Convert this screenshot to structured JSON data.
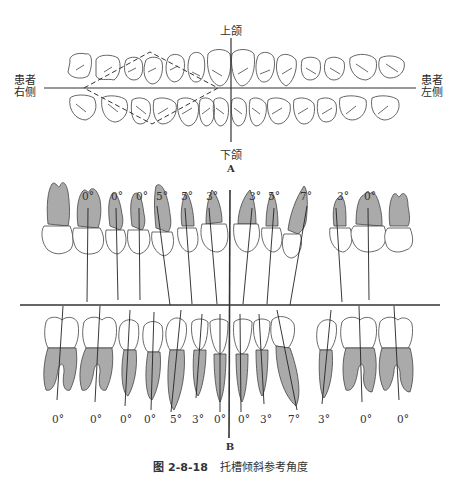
{
  "figure": {
    "number": "图 2-8-18",
    "title": "托槽倾斜参考角度"
  },
  "panel_a": {
    "label": "A",
    "top_label": "上颌",
    "bottom_label": "下颌",
    "left_label_line1": "患者",
    "left_label_line2": "右侧",
    "right_label_line1": "患者",
    "right_label_line2": "左侧",
    "upper_teeth_count": 14,
    "lower_teeth_count": 14
  },
  "panel_b": {
    "label": "B",
    "upper_angles": [
      {
        "x": 88,
        "label": "0°"
      },
      {
        "x": 117,
        "label": "0°"
      },
      {
        "x": 142,
        "label": "0°"
      },
      {
        "x": 162,
        "label": "5°"
      },
      {
        "x": 187,
        "label": "5°"
      },
      {
        "x": 212,
        "label": "3°"
      },
      {
        "x": 255,
        "label": "3°"
      },
      {
        "x": 274,
        "label": "5°"
      },
      {
        "x": 306,
        "label": "7°"
      },
      {
        "x": 343,
        "label": "3°"
      },
      {
        "x": 370,
        "label": "0°"
      }
    ],
    "lower_angles": [
      {
        "x": 58,
        "label": "0°"
      },
      {
        "x": 96,
        "label": "0°"
      },
      {
        "x": 126,
        "label": "0°"
      },
      {
        "x": 150,
        "label": "0°"
      },
      {
        "x": 176,
        "label": "5°"
      },
      {
        "x": 198,
        "label": "3°"
      },
      {
        "x": 220,
        "label": "0°"
      },
      {
        "x": 244,
        "label": "0°"
      },
      {
        "x": 266,
        "label": "3°"
      },
      {
        "x": 294,
        "label": "7°"
      },
      {
        "x": 324,
        "label": "3°"
      },
      {
        "x": 366,
        "label": "0°"
      },
      {
        "x": 403,
        "label": "0°"
      }
    ]
  }
}
